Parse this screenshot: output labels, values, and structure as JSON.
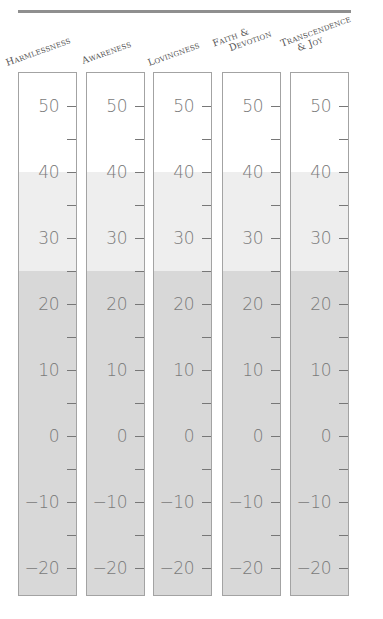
{
  "chart_data": {
    "type": "table",
    "title": "",
    "columns": [
      "Harmlessness",
      "Awareness",
      "Lovingness",
      "Faith & Devotion",
      "Transcendence & Joy"
    ],
    "scale": {
      "min": -20,
      "max": 50,
      "major_step": 10,
      "minor_step": 5,
      "tick_labels": [
        "50",
        "40",
        "30",
        "20",
        "10",
        "0",
        "−10",
        "−20"
      ]
    },
    "bands": [
      {
        "name": "light",
        "from": 25,
        "to": 40,
        "color": "#eeeeee"
      },
      {
        "name": "dark",
        "from": -23,
        "to": 25,
        "color": "#d8d8d8"
      }
    ],
    "layout": {
      "grid": false,
      "legend": "none"
    }
  },
  "header": {
    "labels": [
      {
        "line1": "Harmlessness",
        "line2": ""
      },
      {
        "line1": "Awareness",
        "line2": ""
      },
      {
        "line1": "Lovingness",
        "line2": ""
      },
      {
        "line1": "Faith &",
        "line2": "Devotion"
      },
      {
        "line1": "Transcendence",
        "line2": "& Joy"
      }
    ]
  },
  "ticks": {
    "major": [
      "50",
      "40",
      "30",
      "20",
      "10",
      "0",
      "−10",
      "−20"
    ]
  },
  "colors": {
    "rule": "#8f8f8f",
    "light_band": "#eeeeee",
    "dark_band": "#d8d8d8",
    "border": "#a3a3a3"
  }
}
